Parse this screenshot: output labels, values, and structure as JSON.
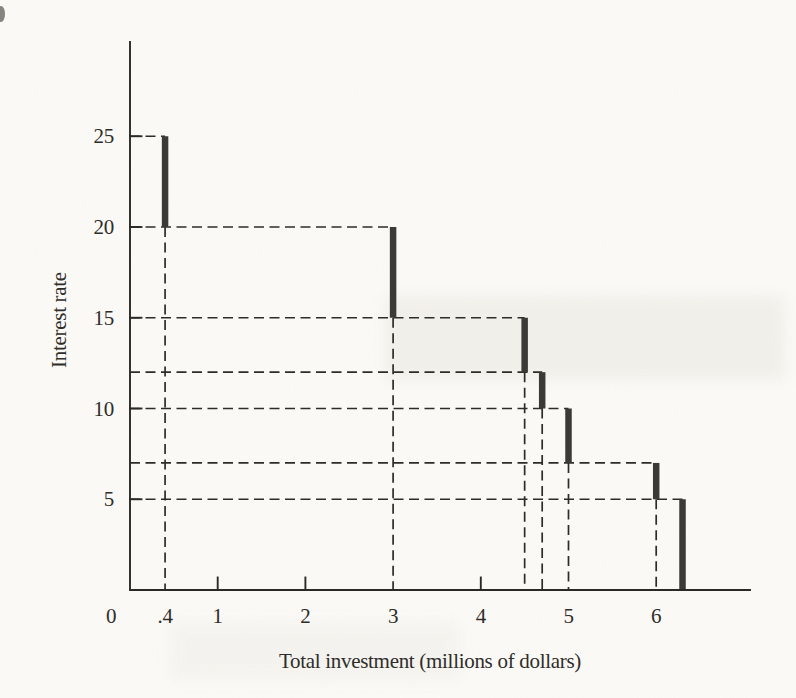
{
  "figure": {
    "kind": "scanned textbook figure",
    "background_color": "#fcfbf8"
  },
  "chart_data": {
    "type": "line",
    "subtype": "step-function investment demand schedule",
    "title": "",
    "xlabel": "Total investment (millions of dollars)",
    "ylabel": "Interest rate",
    "x_tick_labels": [
      "0",
      ".4",
      "1",
      "2",
      "3",
      "4",
      "5",
      "6"
    ],
    "x_tick_values": [
      0,
      0.4,
      1,
      2,
      3,
      4,
      5,
      6
    ],
    "x_solid_tick_values": [
      1,
      2,
      4
    ],
    "y_tick_labels": [
      "5",
      "10",
      "15",
      "20",
      "25"
    ],
    "y_tick_values": [
      5,
      10,
      15,
      20,
      25
    ],
    "xlim": [
      0,
      7.07
    ],
    "ylim": [
      0,
      30.2
    ],
    "grid": "dashed guide lines from axes to each step segment",
    "legend": "none",
    "steps": [
      {
        "cum_investment": 0.4,
        "rate_top": 25,
        "rate_bottom": 20
      },
      {
        "cum_investment": 3.0,
        "rate_top": 20,
        "rate_bottom": 15
      },
      {
        "cum_investment": 4.5,
        "rate_top": 15,
        "rate_bottom": 12
      },
      {
        "cum_investment": 4.7,
        "rate_top": 12,
        "rate_bottom": 10
      },
      {
        "cum_investment": 5.0,
        "rate_top": 10,
        "rate_bottom": 7
      },
      {
        "cum_investment": 6.0,
        "rate_top": 7,
        "rate_bottom": 5
      },
      {
        "cum_investment": 6.3,
        "rate_top": 5,
        "rate_bottom": 0
      }
    ],
    "colors": {
      "axis": "#2b2926",
      "guide": "#2e2c29",
      "segment": "#3c3a37",
      "text": "#2f2d29",
      "background": "#fcfbf8"
    }
  }
}
